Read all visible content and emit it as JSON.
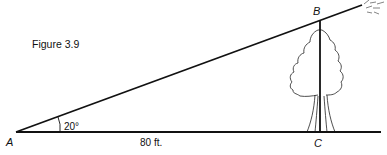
{
  "figure": {
    "caption": "Figure 3.9",
    "points": {
      "A": "A",
      "B": "B",
      "C": "C"
    },
    "angle_label": "20°",
    "distance_label": "80 ft.",
    "objects": [
      "tree",
      "sun-rays"
    ]
  },
  "colors": {
    "ink": "#111111",
    "background": "#ffffff"
  }
}
